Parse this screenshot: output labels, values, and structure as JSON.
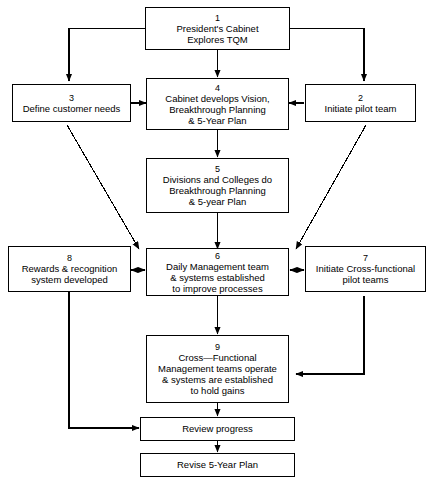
{
  "diagram": {
    "type": "flowchart",
    "nodes": [
      {
        "id": "n1",
        "number": "1",
        "label": "President's Cabinet\nExplores TQM"
      },
      {
        "id": "n2",
        "number": "2",
        "label": "Initiate pilot team"
      },
      {
        "id": "n3",
        "number": "3",
        "label": "Define customer needs"
      },
      {
        "id": "n4",
        "number": "4",
        "label": "Cabinet develops Vision,\nBreakthrough Planning\n& 5-Year Plan"
      },
      {
        "id": "n5",
        "number": "5",
        "label": "Divisions and Colleges do\nBreakthrough Planning\n& 5-year Plan"
      },
      {
        "id": "n6",
        "number": "6",
        "label": "Daily Management team\n& systems established\nto improve processes"
      },
      {
        "id": "n7",
        "number": "7",
        "label": "Initiate Cross-functional\npilot teams"
      },
      {
        "id": "n8",
        "number": "8",
        "label": "Rewards & recognition\nsystem developed"
      },
      {
        "id": "n9",
        "number": "9",
        "label": "Cross—Functional\nManagement teams operate\n& systems are established\nto hold gains"
      },
      {
        "id": "n10",
        "number": "",
        "label": "Review progress"
      },
      {
        "id": "n11",
        "number": "",
        "label": "Revise 5-Year Plan"
      }
    ],
    "edges": [
      {
        "from": "n1",
        "to": "n3",
        "style": "orthogonal-left"
      },
      {
        "from": "n1",
        "to": "n2",
        "style": "orthogonal-right"
      },
      {
        "from": "n1",
        "to": "n4",
        "style": "vertical"
      },
      {
        "from": "n3",
        "to": "n4",
        "style": "horizontal"
      },
      {
        "from": "n2",
        "to": "n4",
        "style": "horizontal"
      },
      {
        "from": "n4",
        "to": "n5",
        "style": "vertical"
      },
      {
        "from": "n3",
        "to": "n6",
        "style": "diagonal"
      },
      {
        "from": "n2",
        "to": "n6",
        "style": "diagonal"
      },
      {
        "from": "n5",
        "to": "n6",
        "style": "vertical"
      },
      {
        "from": "n8",
        "to": "n6",
        "style": "bidirectional"
      },
      {
        "from": "n6",
        "to": "n7",
        "style": "bidirectional"
      },
      {
        "from": "n6",
        "to": "n9",
        "style": "vertical"
      },
      {
        "from": "n7",
        "to": "n9",
        "style": "orthogonal-right"
      },
      {
        "from": "n9",
        "to": "n10",
        "style": "vertical"
      },
      {
        "from": "n8",
        "to": "n10",
        "style": "orthogonal-left"
      },
      {
        "from": "n10",
        "to": "n11",
        "style": "vertical"
      }
    ],
    "colors": {
      "stroke": "#000000",
      "fill": "#ffffff",
      "text": "#000000"
    }
  }
}
